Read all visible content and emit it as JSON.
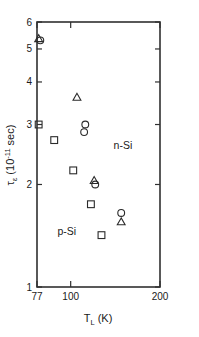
{
  "chart_data": {
    "type": "scatter",
    "title": "",
    "xlabel": "T_L (K)",
    "xlabel_parts": {
      "main": "T",
      "sub": "L",
      "unit": "(K)"
    },
    "ylabel": "τ_ε (10^-11 sec)",
    "ylabel_parts": {
      "main": "τ",
      "sub": "ε",
      "unit_pre": "(10",
      "unit_exp": "-11",
      "unit_post": " sec)"
    },
    "xscale": "log",
    "yscale": "log",
    "xlim": [
      77,
      200
    ],
    "ylim": [
      1,
      6
    ],
    "grid": false,
    "legend": "none",
    "xticks": [
      77,
      100,
      200
    ],
    "xticklabels": [
      "77",
      "100",
      "200"
    ],
    "yticks": [
      1,
      2,
      3,
      4,
      5,
      6
    ],
    "yticklabels": [
      "1",
      "2",
      "3",
      "4",
      "5",
      "6"
    ],
    "annotations": [
      {
        "text": "n-Si",
        "x": 150,
        "y": 2.55
      },
      {
        "text": "p-Si",
        "x": 97,
        "y": 1.42
      }
    ],
    "series": [
      {
        "name": "squares",
        "marker": "square",
        "points": [
          {
            "x": 78,
            "y": 3.0
          },
          {
            "x": 88,
            "y": 2.7
          },
          {
            "x": 102,
            "y": 2.2
          },
          {
            "x": 117,
            "y": 1.75
          },
          {
            "x": 127,
            "y": 1.42
          }
        ]
      },
      {
        "name": "circles",
        "marker": "circle",
        "points": [
          {
            "x": 79,
            "y": 5.3
          },
          {
            "x": 112,
            "y": 3.0
          },
          {
            "x": 111,
            "y": 2.85
          },
          {
            "x": 121,
            "y": 2.0
          },
          {
            "x": 148,
            "y": 1.65
          }
        ]
      },
      {
        "name": "triangles",
        "marker": "triangle",
        "points": [
          {
            "x": 78,
            "y": 5.35
          },
          {
            "x": 105,
            "y": 3.6
          },
          {
            "x": 120,
            "y": 2.05
          },
          {
            "x": 148,
            "y": 1.55
          }
        ]
      }
    ]
  },
  "figure": {
    "axis_color": "#303030",
    "marker_color": "#2a2a2a",
    "background": "#ffffff"
  }
}
